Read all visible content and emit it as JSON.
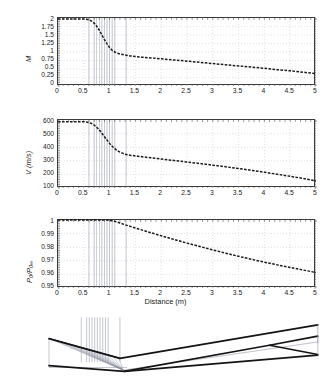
{
  "figure": {
    "xlabel": "Distance (m)",
    "panels": [
      "mach-panel",
      "velocity-panel",
      "pressure-ratio-panel",
      "nozzle-geometry-panel"
    ]
  },
  "axis": {
    "x_ticks": [
      "0",
      "0.5",
      "1",
      "1.5",
      "2",
      "2.5",
      "3",
      "3.5",
      "4",
      "4.5",
      "5"
    ],
    "x_tick_values": [
      0,
      0.5,
      1,
      1.5,
      2,
      2.5,
      3,
      3.5,
      4,
      4.5,
      5
    ],
    "x_title": "Distance (m)"
  },
  "labels": {
    "mach_y": "M",
    "velocity_y": "V (m/s)",
    "pressure_y_num": "P",
    "pressure_y_num_sub": "0",
    "pressure_y_den": "P",
    "pressure_y_den_sub": "0∞",
    "pressure_y_full": "P0/P0∞"
  },
  "colors": {
    "curve": "#1a1a1a",
    "grid": "#cccccc",
    "axis": "#3b3b3b",
    "char_line": "#8a8fa0",
    "wall": "#141414",
    "accent_blue": "#2d4fa0"
  },
  "chart_data": [
    {
      "id": "mach-panel",
      "type": "line",
      "title": "",
      "xlabel": "",
      "ylabel": "M",
      "xlim": [
        0,
        5
      ],
      "ylim": [
        0,
        2
      ],
      "grid": true,
      "legend": "none",
      "yticks": [
        0,
        0.25,
        0.5,
        0.75,
        1,
        1.25,
        1.5,
        1.75,
        2
      ],
      "ytick_labels": [
        "0",
        "0.25",
        "0.5",
        "0.75",
        "1",
        "1.25",
        "1.5",
        "1.75",
        "2"
      ],
      "xticks": [
        0,
        0.5,
        1,
        1.5,
        2,
        2.5,
        3,
        3.5,
        4,
        4.5,
        5
      ],
      "series": [
        {
          "name": "Mach number",
          "x": [
            0,
            0.1,
            0.2,
            0.3,
            0.4,
            0.5,
            0.55,
            0.6,
            0.65,
            0.7,
            0.75,
            0.8,
            0.85,
            0.9,
            0.95,
            1.0,
            1.05,
            1.1,
            1.15,
            1.2,
            1.25,
            1.3,
            1.35,
            1.4,
            1.5,
            1.6,
            1.8,
            2.0,
            2.25,
            2.5,
            2.75,
            3.0,
            3.25,
            3.5,
            3.75,
            4.0,
            4.25,
            4.5,
            4.75,
            5.0
          ],
          "y": [
            1.97,
            1.97,
            1.97,
            1.97,
            1.97,
            1.97,
            1.96,
            1.95,
            1.91,
            1.85,
            1.76,
            1.64,
            1.5,
            1.36,
            1.24,
            1.13,
            1.05,
            1.0,
            0.965,
            0.94,
            0.925,
            0.91,
            0.895,
            0.885,
            0.865,
            0.85,
            0.825,
            0.8,
            0.765,
            0.73,
            0.695,
            0.66,
            0.625,
            0.59,
            0.555,
            0.52,
            0.48,
            0.445,
            0.405,
            0.365
          ]
        }
      ],
      "vertical_markers": [
        0.6,
        0.7,
        0.75,
        0.8,
        0.85,
        0.9,
        0.95,
        1.0,
        1.05,
        1.1,
        1.32
      ]
    },
    {
      "id": "velocity-panel",
      "type": "line",
      "title": "",
      "xlabel": "",
      "ylabel": "V (m/s)",
      "xlim": [
        0,
        5
      ],
      "ylim": [
        100,
        600
      ],
      "grid": true,
      "legend": "none",
      "yticks": [
        100,
        200,
        300,
        400,
        500,
        600
      ],
      "ytick_labels": [
        "100",
        "200",
        "300",
        "400",
        "500",
        "600"
      ],
      "xticks": [
        0,
        0.5,
        1,
        1.5,
        2,
        2.5,
        3,
        3.5,
        4,
        4.5,
        5
      ],
      "series": [
        {
          "name": "Velocity",
          "x": [
            0,
            0.1,
            0.2,
            0.3,
            0.4,
            0.5,
            0.55,
            0.6,
            0.65,
            0.7,
            0.75,
            0.8,
            0.85,
            0.9,
            0.95,
            1.0,
            1.05,
            1.1,
            1.15,
            1.2,
            1.25,
            1.3,
            1.35,
            1.4,
            1.5,
            1.6,
            1.8,
            2.0,
            2.25,
            2.5,
            2.75,
            3.0,
            3.25,
            3.5,
            3.75,
            4.0,
            4.25,
            4.5,
            4.75,
            5.0
          ],
          "y": [
            588,
            588,
            588,
            588,
            588,
            587,
            585,
            582,
            574,
            563,
            547,
            527,
            503,
            477,
            452,
            428,
            407,
            390,
            375,
            364,
            356,
            348,
            344,
            341,
            336,
            331,
            322,
            313,
            302,
            291,
            280,
            268,
            256,
            243,
            230,
            216,
            201,
            186,
            170,
            152
          ]
        }
      ],
      "vertical_markers": [
        0.6,
        0.7,
        0.75,
        0.8,
        0.85,
        0.9,
        0.95,
        1.0,
        1.05,
        1.1,
        1.32
      ]
    },
    {
      "id": "pressure-ratio-panel",
      "type": "line",
      "title": "",
      "xlabel": "Distance (m)",
      "ylabel": "P0/P0∞",
      "xlim": [
        0,
        5
      ],
      "ylim": [
        0.95,
        1.0
      ],
      "grid": true,
      "legend": "none",
      "yticks": [
        0.95,
        0.96,
        0.97,
        0.98,
        0.99,
        1.0
      ],
      "ytick_labels": [
        "0.95",
        "0.96",
        "0.97",
        "0.98",
        "0.99",
        "1"
      ],
      "xticks": [
        0,
        0.5,
        1,
        1.5,
        2,
        2.5,
        3,
        3.5,
        4,
        4.5,
        5
      ],
      "series": [
        {
          "name": "Total pressure ratio",
          "x": [
            0,
            0.2,
            0.4,
            0.5,
            0.6,
            0.7,
            0.8,
            0.9,
            1.0,
            1.05,
            1.1,
            1.2,
            1.3,
            1.4,
            1.5,
            1.75,
            2.0,
            2.25,
            2.5,
            2.75,
            3.0,
            3.25,
            3.5,
            3.75,
            4.0,
            4.25,
            4.5,
            4.75,
            5.0
          ],
          "y": [
            1.0,
            1.0,
            1.0,
            1.0,
            1.0,
            1.0,
            1.0,
            1.0,
            0.9997,
            0.9994,
            0.999,
            0.9978,
            0.9965,
            0.9953,
            0.9941,
            0.9912,
            0.9884,
            0.9857,
            0.983,
            0.9805,
            0.978,
            0.9756,
            0.9733,
            0.9711,
            0.969,
            0.967,
            0.9651,
            0.9632,
            0.9614
          ]
        }
      ],
      "vertical_markers": [
        0.6,
        0.7,
        0.75,
        0.8,
        0.85,
        0.9,
        0.95,
        1.0,
        1.05,
        1.1,
        1.32
      ]
    },
    {
      "id": "nozzle-geometry-panel",
      "type": "line",
      "title": "",
      "xlabel": "",
      "ylabel": "",
      "xlim": [
        0,
        5
      ],
      "ylim": [
        -1,
        1
      ],
      "grid": false,
      "legend": "none",
      "description": "converging-diverging nozzle wall contour with method-of-characteristics lines and reflected shock",
      "series": [
        {
          "name": "upper wall",
          "x": [
            0.0,
            1.32,
            5.0
          ],
          "y": [
            0.3,
            -0.3,
            0.72
          ]
        },
        {
          "name": "lower wall",
          "x": [
            0.0,
            1.4,
            5.0
          ],
          "y": [
            -0.52,
            -0.7,
            -0.2
          ]
        },
        {
          "name": "shock",
          "x": [
            1.4,
            4.1,
            5.0
          ],
          "y": [
            -0.7,
            0.1,
            0.38
          ]
        },
        {
          "name": "reflected shock",
          "x": [
            4.1,
            5.0
          ],
          "y": [
            0.1,
            -0.18
          ]
        }
      ],
      "vertical_markers": [
        0.6,
        0.7,
        0.75,
        0.8,
        0.85,
        0.9,
        0.95,
        1.0,
        1.05,
        1.1,
        1.32
      ]
    }
  ]
}
